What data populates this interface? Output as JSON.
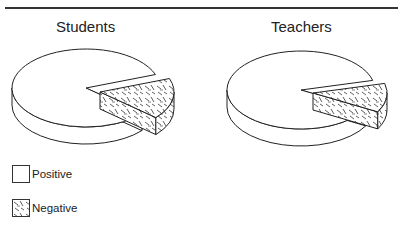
{
  "chart_data": [
    {
      "type": "pie",
      "title": "Students",
      "categories": [
        "Positive",
        "Negative"
      ],
      "values": [
        83,
        17
      ],
      "exploded": [
        "Negative"
      ],
      "style": "3d-exploded-pie"
    },
    {
      "type": "pie",
      "title": "Teachers",
      "categories": [
        "Positive",
        "Negative"
      ],
      "values": [
        88,
        12
      ],
      "exploded": [
        "Negative"
      ],
      "style": "3d-exploded-pie"
    }
  ],
  "titles": {
    "students": "Students",
    "teachers": "Teachers"
  },
  "legend": {
    "position": "bottom-left",
    "items": [
      {
        "label": "Positive",
        "fill": "blank"
      },
      {
        "label": "Negative",
        "fill": "hatched"
      }
    ]
  },
  "colors": {
    "line": "#222222",
    "background": "#ffffff",
    "positive_fill": "#ffffff"
  }
}
